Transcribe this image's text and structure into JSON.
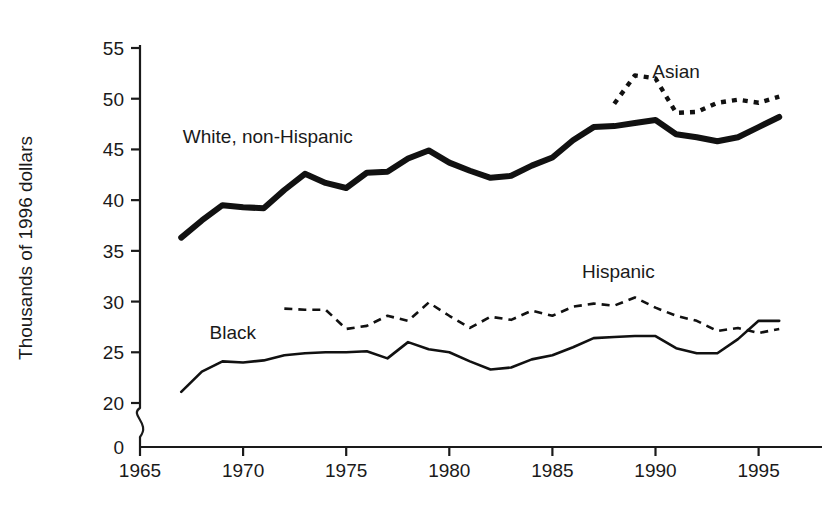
{
  "chart_data": {
    "type": "line",
    "title": "",
    "subtitle": "",
    "xlabel": "",
    "ylabel": "Thousands of 1996 dollars",
    "xlim": [
      1963.5,
      1996.8
    ],
    "ylim": [
      19.2,
      55
    ],
    "y_axis_break": true,
    "y_zero_shown": true,
    "grid": false,
    "legend_position": "inline-annotations",
    "x_ticks": [
      1965,
      1970,
      1975,
      1980,
      1985,
      1990,
      1995
    ],
    "x_tick_labels": [
      "1965",
      "1970",
      "1975",
      "1980",
      "1985",
      "1990",
      "1995"
    ],
    "y_ticks": [
      0,
      20,
      25,
      30,
      35,
      40,
      45,
      50,
      55
    ],
    "y_tick_labels": [
      "0",
      "20",
      "25",
      "30",
      "35",
      "40",
      "45",
      "50",
      "55"
    ],
    "series": [
      {
        "name": "White, non-Hispanic",
        "label": "White, non-Hispanic",
        "style": "thick-solid",
        "label_x": 1971.2,
        "label_y": 45.6,
        "x": [
          1967,
          1968,
          1969,
          1970,
          1971,
          1972,
          1973,
          1974,
          1975,
          1976,
          1977,
          1978,
          1979,
          1980,
          1981,
          1982,
          1983,
          1984,
          1985,
          1986,
          1987,
          1988,
          1989,
          1990,
          1991,
          1992,
          1993,
          1994,
          1995,
          1996
        ],
        "values": [
          36.3,
          38.0,
          39.5,
          39.3,
          39.2,
          41.0,
          42.6,
          41.7,
          41.2,
          42.7,
          42.8,
          44.1,
          44.9,
          43.7,
          42.9,
          42.2,
          42.4,
          43.4,
          44.2,
          45.9,
          47.2,
          47.3,
          47.6,
          47.9,
          46.5,
          46.2,
          45.8,
          46.2,
          47.2,
          48.2
        ]
      },
      {
        "name": "Asian",
        "label": "Asian",
        "style": "thick-dotted",
        "label_x": 1991.0,
        "label_y": 52.0,
        "x": [
          1988,
          1989,
          1990,
          1991,
          1992,
          1993,
          1994,
          1995,
          1996
        ],
        "values": [
          49.5,
          52.3,
          52.0,
          48.6,
          48.7,
          49.6,
          49.9,
          49.6,
          50.2
        ]
      },
      {
        "name": "Hispanic",
        "label": "Hispanic",
        "style": "thin-dashed",
        "label_x": 1988.2,
        "label_y": 32.3,
        "x": [
          1972,
          1973,
          1974,
          1975,
          1976,
          1977,
          1978,
          1979,
          1980,
          1981,
          1982,
          1983,
          1984,
          1985,
          1986,
          1987,
          1988,
          1989,
          1990,
          1991,
          1992,
          1993,
          1994,
          1995,
          1996
        ],
        "values": [
          29.3,
          29.2,
          29.2,
          27.3,
          27.6,
          28.6,
          28.1,
          29.9,
          28.6,
          27.4,
          28.5,
          28.2,
          29.1,
          28.6,
          29.5,
          29.8,
          29.6,
          30.4,
          29.4,
          28.6,
          28.1,
          27.1,
          27.4,
          26.9,
          27.3
        ]
      },
      {
        "name": "Black",
        "label": "Black",
        "style": "thin-solid",
        "label_x": 1969.5,
        "label_y": 26.3,
        "x": [
          1967,
          1968,
          1969,
          1970,
          1971,
          1972,
          1973,
          1974,
          1975,
          1976,
          1977,
          1978,
          1979,
          1980,
          1981,
          1982,
          1983,
          1984,
          1985,
          1986,
          1987,
          1988,
          1989,
          1990,
          1991,
          1992,
          1993,
          1994,
          1995,
          1996
        ],
        "values": [
          21.1,
          23.1,
          24.1,
          24.0,
          24.2,
          24.7,
          24.9,
          25.0,
          25.0,
          25.1,
          24.4,
          26.0,
          25.3,
          25.0,
          24.1,
          23.3,
          23.5,
          24.3,
          24.7,
          25.5,
          26.4,
          26.5,
          26.6,
          26.6,
          25.4,
          24.9,
          24.9,
          26.3,
          28.1,
          28.1
        ]
      }
    ]
  }
}
